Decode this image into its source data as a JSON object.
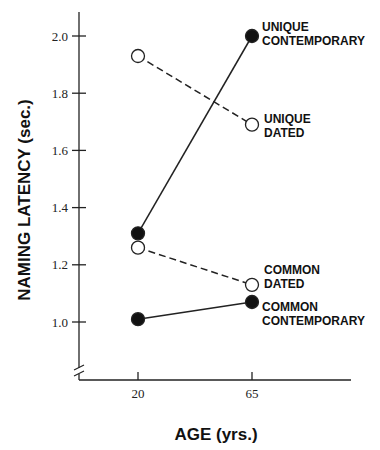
{
  "chart_data": {
    "type": "line",
    "title": "",
    "xlabel": "AGE (yrs.)",
    "ylabel": "NAMING LATENCY (sec.)",
    "categories": [
      "20",
      "65"
    ],
    "x": [
      20,
      65
    ],
    "ylim": [
      0.85,
      2.1
    ],
    "yticks": [
      1.0,
      1.2,
      1.4,
      1.6,
      1.8,
      2.0
    ],
    "ytick_labels": [
      "1.0",
      "1.2",
      "1.4",
      "1.6",
      "1.8",
      "2.0"
    ],
    "grid": false,
    "axis_break": true,
    "series": [
      {
        "name": "UNIQUE CONTEMPORARY",
        "label_lines": [
          "UNIQUE",
          "CONTEMPORARY"
        ],
        "values": [
          1.31,
          2.0
        ],
        "marker": "filled",
        "line": "solid"
      },
      {
        "name": "UNIQUE DATED",
        "label_lines": [
          "UNIQUE",
          "DATED"
        ],
        "values": [
          1.93,
          1.69
        ],
        "marker": "open",
        "line": "dashed"
      },
      {
        "name": "COMMON DATED",
        "label_lines": [
          "COMMON",
          "DATED"
        ],
        "values": [
          1.26,
          1.13
        ],
        "marker": "open",
        "line": "dashed"
      },
      {
        "name": "COMMON CONTEMPORARY",
        "label_lines": [
          "COMMON",
          "CONTEMPORARY"
        ],
        "values": [
          1.01,
          1.07
        ],
        "marker": "filled",
        "line": "solid"
      }
    ]
  }
}
